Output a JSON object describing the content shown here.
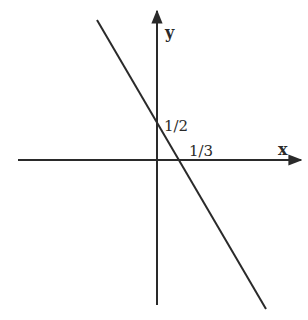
{
  "diagram": {
    "type": "cartesian-line-graph",
    "axes": {
      "x_label": "x",
      "y_label": "y"
    },
    "annotations": {
      "y_intercept": "1/2",
      "x_intercept": "1/3"
    },
    "line": {
      "description": "Straight line with negative slope crossing y-axis at 1/2 and x-axis at 1/3",
      "slope_sign": "negative"
    },
    "colors": {
      "ink": "#2a2a2a",
      "background": "#ffffff"
    }
  }
}
